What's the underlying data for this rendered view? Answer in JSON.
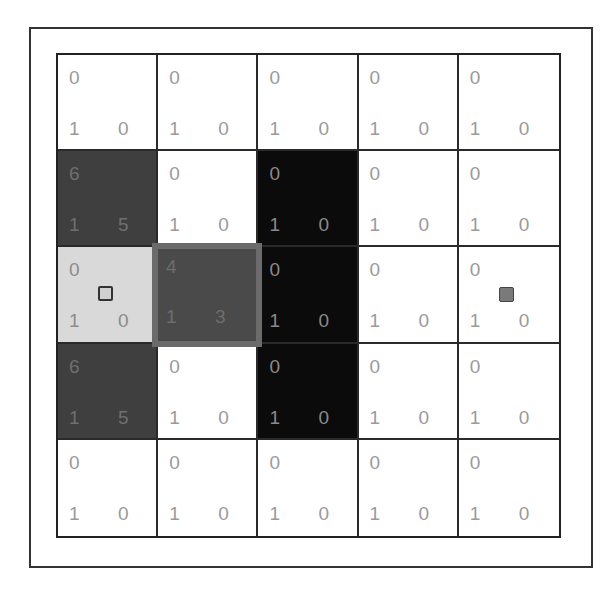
{
  "board": {
    "rows": 5,
    "cols": 5,
    "cells": [
      [
        {
          "type": "white",
          "top": "0",
          "bottom_left": "1",
          "bottom_right": "0"
        },
        {
          "type": "white",
          "top": "0",
          "bottom_left": "1",
          "bottom_right": "0"
        },
        {
          "type": "white",
          "top": "0",
          "bottom_left": "1",
          "bottom_right": "0"
        },
        {
          "type": "white",
          "top": "0",
          "bottom_left": "1",
          "bottom_right": "0"
        },
        {
          "type": "white",
          "top": "0",
          "bottom_left": "1",
          "bottom_right": "0"
        }
      ],
      [
        {
          "type": "dark",
          "top": "6",
          "bottom_left": "1",
          "bottom_right": "5"
        },
        {
          "type": "white",
          "top": "0",
          "bottom_left": "1",
          "bottom_right": "0"
        },
        {
          "type": "black",
          "top": "0",
          "bottom_left": "1",
          "bottom_right": "0"
        },
        {
          "type": "white",
          "top": "0",
          "bottom_left": "1",
          "bottom_right": "0"
        },
        {
          "type": "white",
          "top": "0",
          "bottom_left": "1",
          "bottom_right": "0"
        }
      ],
      [
        {
          "type": "light",
          "top": "0",
          "bottom_left": "1",
          "bottom_right": "0"
        },
        {
          "type": "highlight",
          "top": "4",
          "bottom_left": "1",
          "bottom_right": "3"
        },
        {
          "type": "black",
          "top": "0",
          "bottom_left": "1",
          "bottom_right": "0"
        },
        {
          "type": "white",
          "top": "0",
          "bottom_left": "1",
          "bottom_right": "0"
        },
        {
          "type": "white",
          "top": "0",
          "bottom_left": "1",
          "bottom_right": "0"
        }
      ],
      [
        {
          "type": "dark",
          "top": "6",
          "bottom_left": "1",
          "bottom_right": "5"
        },
        {
          "type": "white",
          "top": "0",
          "bottom_left": "1",
          "bottom_right": "0"
        },
        {
          "type": "black",
          "top": "0",
          "bottom_left": "1",
          "bottom_right": "0"
        },
        {
          "type": "white",
          "top": "0",
          "bottom_left": "1",
          "bottom_right": "0"
        },
        {
          "type": "white",
          "top": "0",
          "bottom_left": "1",
          "bottom_right": "0"
        }
      ],
      [
        {
          "type": "white",
          "top": "0",
          "bottom_left": "1",
          "bottom_right": "0"
        },
        {
          "type": "white",
          "top": "0",
          "bottom_left": "1",
          "bottom_right": "0"
        },
        {
          "type": "white",
          "top": "0",
          "bottom_left": "1",
          "bottom_right": "0"
        },
        {
          "type": "white",
          "top": "0",
          "bottom_left": "1",
          "bottom_right": "0"
        },
        {
          "type": "white",
          "top": "0",
          "bottom_left": "1",
          "bottom_right": "0"
        }
      ]
    ],
    "agent": {
      "row": 2,
      "col": 0,
      "icon": "hollow-square-icon"
    },
    "goal": {
      "row": 2,
      "col": 4,
      "icon": "filled-square-icon"
    },
    "highlighted_cell": {
      "row": 2,
      "col": 1
    }
  },
  "colors": {
    "white": "#ffffff",
    "dark": "#3f3f3f",
    "black": "#0b0b0b",
    "light": "#d9d9d9",
    "highlight_fill": "#4a4a4a",
    "highlight_border": "#6b6b6b",
    "text": "#9a9a9a"
  }
}
